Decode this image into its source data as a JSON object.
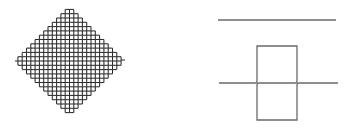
{
  "figure": {
    "width": 352,
    "height": 129,
    "background": "#ffffff",
    "stroke_color": "#2a2a2a",
    "light_stroke_color": "#6a6a6a"
  },
  "left_panel": {
    "shape": "diamond-grid",
    "center": [
      69.5,
      61
    ],
    "half_width": 52,
    "half_height": 52,
    "cell_size": 4.3,
    "grid_lines": 25,
    "nubs": {
      "top": [
        69.5,
        7
      ],
      "bottom": [
        69.5,
        115
      ],
      "left": [
        15,
        61
      ],
      "right": [
        125,
        60
      ]
    }
  },
  "right_panel": {
    "top_line": {
      "x1": 218,
      "x2": 336,
      "y": 20
    },
    "middle_line": {
      "x1": 219,
      "x2": 338,
      "y": 83
    },
    "box": {
      "x1": 257,
      "x2": 297,
      "y1": 46,
      "y2": 120
    }
  }
}
